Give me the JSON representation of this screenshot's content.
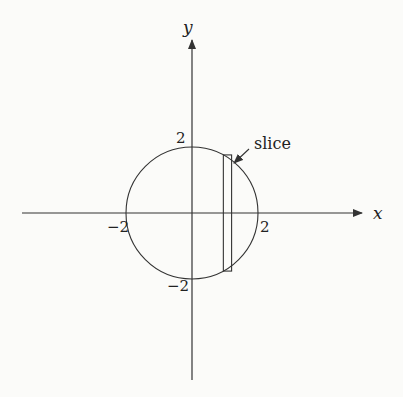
{
  "diagram": {
    "type": "coordinate-diagram",
    "axes": {
      "x_label": "x",
      "y_label": "y"
    },
    "tick_labels": {
      "x_neg": "−2",
      "x_pos": "2",
      "y_pos": "2",
      "y_neg": "−2"
    },
    "circle": {
      "center": [
        0,
        0
      ],
      "radius": 2
    },
    "slice": {
      "label": "slice",
      "x_range": [
        0.95,
        1.2
      ]
    },
    "colors": {
      "stroke": "#333333",
      "background": "#fbfbf9"
    }
  }
}
